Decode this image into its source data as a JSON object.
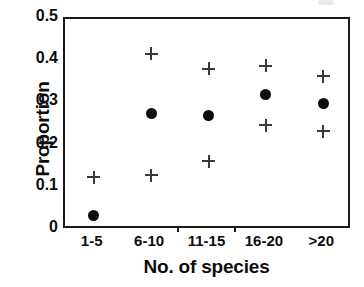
{
  "chart_data": {
    "type": "scatter",
    "title": "",
    "xlabel": "No. of species",
    "ylabel": "Proportion",
    "categories": [
      "1-5",
      "6-10",
      "11-15",
      "16-20",
      ">20"
    ],
    "ylim": [
      0,
      0.5
    ],
    "yticks": [
      0,
      0.1,
      0.2,
      0.3,
      0.4,
      0.5
    ],
    "ytick_labels": [
      "0",
      "0.1",
      "0.2",
      "0.3",
      "0.4",
      "0.5"
    ],
    "grid": false,
    "legend": "none",
    "series": [
      {
        "name": "mean",
        "marker": "filled-circle",
        "color": "#0d0d0d",
        "values": [
          0.035,
          0.277,
          0.272,
          0.322,
          0.299
        ]
      },
      {
        "name": "upper-bound",
        "marker": "plus",
        "color": "#3a3a3a",
        "values": [
          null,
          0.418,
          0.382,
          0.389,
          0.364
        ]
      },
      {
        "name": "lower-bound",
        "marker": "plus",
        "color": "#3a3a3a",
        "values": [
          0.125,
          0.13,
          0.163,
          0.248,
          0.234
        ]
      }
    ]
  },
  "axes": {
    "y_title": "Proportion",
    "x_title": "No. of species"
  }
}
